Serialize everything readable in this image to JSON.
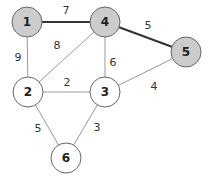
{
  "graph": {
    "nodes": [
      {
        "id": "1",
        "label": "1",
        "x": 27,
        "y": 22,
        "highlighted": true
      },
      {
        "id": "4",
        "label": "4",
        "x": 105,
        "y": 22,
        "highlighted": true
      },
      {
        "id": "5",
        "label": "5",
        "x": 186,
        "y": 52,
        "highlighted": true
      },
      {
        "id": "2",
        "label": "2",
        "x": 28,
        "y": 92,
        "highlighted": false
      },
      {
        "id": "3",
        "label": "3",
        "x": 105,
        "y": 92,
        "highlighted": false
      },
      {
        "id": "6",
        "label": "6",
        "x": 66,
        "y": 158,
        "highlighted": false
      }
    ],
    "edges": [
      {
        "from": "1",
        "to": "4",
        "weight": "7",
        "highlighted": true,
        "lx": 66,
        "ly": 14
      },
      {
        "from": "4",
        "to": "5",
        "weight": "5",
        "highlighted": true,
        "lx": 148,
        "ly": 29
      },
      {
        "from": "1",
        "to": "2",
        "weight": "9",
        "highlighted": false,
        "lx": 18,
        "ly": 61
      },
      {
        "from": "4",
        "to": "2",
        "weight": "8",
        "highlighted": false,
        "lx": 57,
        "ly": 49
      },
      {
        "from": "4",
        "to": "3",
        "weight": "6",
        "highlighted": false,
        "lx": 113,
        "ly": 66
      },
      {
        "from": "5",
        "to": "3",
        "weight": "4",
        "highlighted": false,
        "lx": 154,
        "ly": 90
      },
      {
        "from": "2",
        "to": "3",
        "weight": "2",
        "highlighted": false,
        "lx": 67,
        "ly": 86
      },
      {
        "from": "2",
        "to": "6",
        "weight": "5",
        "highlighted": false,
        "lx": 38,
        "ly": 132
      },
      {
        "from": "3",
        "to": "6",
        "weight": "3",
        "highlighted": false,
        "lx": 97,
        "ly": 131
      }
    ],
    "colors": {
      "highlight_fill": "#cccccc",
      "normal_fill": "#ffffff",
      "stroke": "#666666",
      "highlight_edge": "#333333",
      "normal_edge": "#999999"
    }
  }
}
